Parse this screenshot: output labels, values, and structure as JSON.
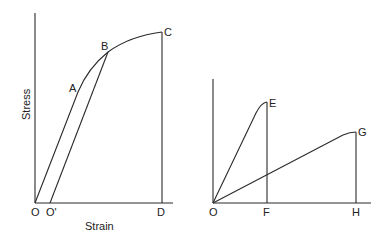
{
  "left_diagram": {
    "y_axis_label": "Stress",
    "x_axis_label": "Strain",
    "points": {
      "O": "O",
      "O_prime": "O'",
      "A": "A",
      "B": "B",
      "C": "C",
      "D": "D"
    }
  },
  "right_diagram": {
    "points": {
      "O": "O",
      "E": "E",
      "F": "F",
      "G": "G",
      "H": "H"
    }
  },
  "colors": {
    "line": "#2a2a2a",
    "background": "#ffffff"
  }
}
